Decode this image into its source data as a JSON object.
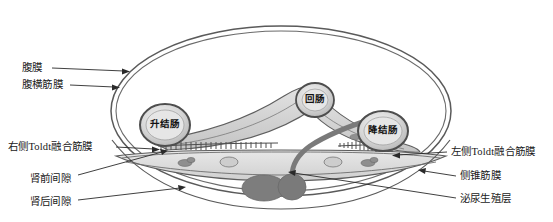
{
  "figure": {
    "type": "anatomical-cross-section",
    "background_color": "#ffffff",
    "line_color": "#4a4a4a",
    "fill_light": "#dcdcdc",
    "fill_mid": "#c0c0c0",
    "fill_dark": "#8c8c8c",
    "fill_darker": "#7a7a7a"
  },
  "organs": [
    {
      "id": "ascending-colon",
      "label": "升结肠",
      "cx": 165,
      "cy": 125,
      "rx": 25,
      "ry": 21
    },
    {
      "id": "ileum",
      "label": "回肠",
      "cx": 315,
      "cy": 100,
      "rx": 19,
      "ry": 17
    },
    {
      "id": "descending-colon",
      "label": "降结肠",
      "cx": 383,
      "cy": 131,
      "rx": 25,
      "ry": 20
    }
  ],
  "labels_left": [
    {
      "id": "peritoneum",
      "text": "腹膜",
      "x": 22,
      "y": 63,
      "leader": {
        "x1": 52,
        "y1": 68,
        "x2": 127,
        "y2": 71
      }
    },
    {
      "id": "transversalis-fascia",
      "text": "腹横筋膜",
      "x": 22,
      "y": 80,
      "leader": {
        "x1": 70,
        "y1": 85,
        "x2": 119,
        "y2": 87
      }
    },
    {
      "id": "right-toldt-fusion-fascia",
      "text": "右侧Toldt融合筋膜",
      "x": 8,
      "y": 142,
      "leader": {
        "x1": 116,
        "y1": 147,
        "x2": 159,
        "y2": 150
      }
    },
    {
      "id": "anterior-pararenal-space",
      "text": "肾前间隙",
      "x": 30,
      "y": 174,
      "leader": {
        "x1": 78,
        "y1": 175,
        "x2": 167,
        "y2": 152
      }
    },
    {
      "id": "posterior-pararenal-space",
      "text": "肾后间隙",
      "x": 30,
      "y": 197,
      "leader": {
        "x1": 78,
        "y1": 200,
        "x2": 185,
        "y2": 187
      }
    }
  ],
  "labels_right": [
    {
      "id": "left-toldt-fusion-fascia",
      "text": "左侧Toldt融合筋膜",
      "x": 451,
      "y": 147,
      "leader": {
        "x1": 447,
        "y1": 152,
        "x2": 392,
        "y2": 156
      }
    },
    {
      "id": "lateroconal-fascia",
      "text": "侧锥筋膜",
      "x": 460,
      "y": 171,
      "leader": {
        "x1": 456,
        "y1": 176,
        "x2": 418,
        "y2": 170
      }
    },
    {
      "id": "urogenital-layer",
      "text": "泌尿生殖层",
      "x": 460,
      "y": 194,
      "leader": {
        "x1": 456,
        "y1": 198,
        "x2": 288,
        "y2": 172
      }
    }
  ]
}
